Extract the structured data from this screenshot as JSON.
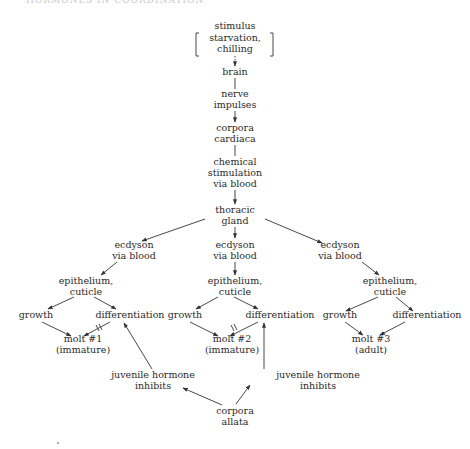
{
  "header": {
    "text": "HORMONES IN COORDINATION"
  },
  "nodes": {
    "stimulus": [
      "stimulus",
      "starvation,",
      "chilling"
    ],
    "brain": [
      "brain"
    ],
    "nerve_impulses": [
      "nerve",
      "impulses"
    ],
    "corpora_cardiaca": [
      "corpora",
      "cardiaca"
    ],
    "chemical_stimulation": [
      "chemical",
      "stimulation",
      "via blood"
    ],
    "thoracic_gland": [
      "thoracic",
      "gland"
    ],
    "branches": [
      {
        "ecdyson": [
          "ecdyson",
          "via blood"
        ],
        "epithelium": [
          "epithelium,",
          "cuticle"
        ],
        "growth": "growth",
        "differentiation": "differentiation",
        "molt": [
          "molt  #1",
          "(immature)"
        ]
      },
      {
        "ecdyson": [
          "ecdyson",
          "via blood"
        ],
        "epithelium": [
          "epithelium,",
          "cuticle"
        ],
        "growth": "growth",
        "differentiation": "differentiation",
        "molt": [
          "molt  #2",
          "(immature)"
        ]
      },
      {
        "ecdyson": [
          "ecdyson",
          "via blood"
        ],
        "epithelium": [
          "epithelium,",
          "cuticle"
        ],
        "growth": "growth",
        "differentiation": "differentiation",
        "molt": [
          "molt  #3",
          "(adult)"
        ]
      }
    ],
    "juvenile_left": [
      "juvenile hormone",
      "inhibits"
    ],
    "juvenile_right": [
      "juvenile hormone",
      "inhibits"
    ],
    "corpora_allata": [
      "corpora",
      "allata"
    ]
  },
  "colors": {
    "ink": "#2a2a2a",
    "background": "#ffffff"
  }
}
